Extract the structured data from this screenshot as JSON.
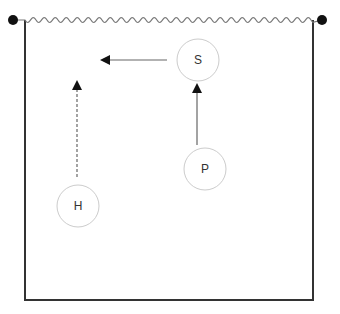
{
  "diagram": {
    "container": {
      "left": 25,
      "right": 313,
      "top": 20,
      "bottom": 300,
      "wall_color": "#333333",
      "surface_color": "#777777",
      "anchor_color": "#111111",
      "anchors": [
        {
          "x": 13,
          "y": 20
        },
        {
          "x": 322,
          "y": 20
        }
      ]
    },
    "nodes": [
      {
        "id": "S",
        "label": "S",
        "cx": 198,
        "cy": 60,
        "r": 21
      },
      {
        "id": "P",
        "label": "P",
        "cx": 205,
        "cy": 169,
        "r": 21
      },
      {
        "id": "H",
        "label": "H",
        "cx": 78,
        "cy": 206,
        "r": 21
      }
    ],
    "arrows": [
      {
        "id": "s-left",
        "from": "S",
        "x1": 167,
        "y1": 60,
        "x2": 102,
        "y2": 60,
        "style": "solid"
      },
      {
        "id": "p-to-s",
        "from": "P",
        "to": "S",
        "x1": 197,
        "y1": 145,
        "x2": 197,
        "y2": 85,
        "style": "solid"
      },
      {
        "id": "h-up",
        "from": "H",
        "x1": 77,
        "y1": 177,
        "x2": 77,
        "y2": 82,
        "style": "dashed"
      }
    ],
    "node_stroke": "#cccccc",
    "arrow_color": "#111111",
    "arrow_line_color": "#666666"
  }
}
